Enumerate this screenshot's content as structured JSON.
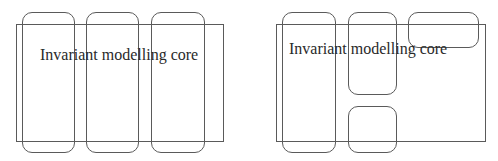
{
  "diagrams": [
    {
      "name": "left-architecture",
      "core": {
        "label": "Invariant modelling core",
        "rect": {
          "x": 16,
          "y": 24,
          "w": 208,
          "h": 118
        },
        "label_pos": {
          "x": 40,
          "y": 47
        }
      },
      "modules": [
        {
          "x": 22,
          "y": 12,
          "w": 53,
          "h": 141
        },
        {
          "x": 86,
          "y": 12,
          "w": 53,
          "h": 141
        },
        {
          "x": 151,
          "y": 12,
          "w": 54,
          "h": 141
        }
      ]
    },
    {
      "name": "right-architecture",
      "core": {
        "label": "Invariant modelling core",
        "rect": {
          "x": 276,
          "y": 24,
          "w": 210,
          "h": 118
        },
        "label_pos": {
          "x": 289,
          "y": 41
        }
      },
      "modules": [
        {
          "x": 282,
          "y": 12,
          "w": 54,
          "h": 141
        },
        {
          "x": 348,
          "y": 12,
          "w": 49,
          "h": 83
        },
        {
          "x": 408,
          "y": 12,
          "w": 71,
          "h": 36
        },
        {
          "x": 348,
          "y": 106,
          "w": 49,
          "h": 47
        }
      ]
    }
  ],
  "colors": {
    "line": "#5a5a5a",
    "text": "#2a2a2a",
    "background": "#ffffff"
  }
}
